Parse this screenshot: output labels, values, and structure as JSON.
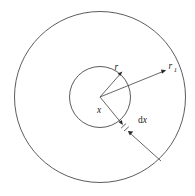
{
  "figure": {
    "type": "geometry-diagram",
    "background_color": "#ffffff",
    "line_color": "#4a4a4a",
    "label_color": "#1c1c1c",
    "canvas": {
      "width": 195,
      "height": 196
    },
    "center": {
      "x": 100,
      "y": 97
    },
    "circles": [
      {
        "name": "outer-circle",
        "cx": 100,
        "cy": 97,
        "r": 85.5
      },
      {
        "name": "inner-circle",
        "cx": 100,
        "cy": 97,
        "r": 30.5
      }
    ],
    "labels": {
      "r": "r",
      "r1_base": "r",
      "r1_sub": "1",
      "x": "x",
      "dx_d": "d",
      "dx_x": "x"
    },
    "arrows": [
      {
        "name": "radius-r-arrow",
        "from": [
          100,
          97
        ],
        "to": [
          122,
          72
        ],
        "label": "r"
      },
      {
        "name": "radius-r1-arrow",
        "from": [
          100,
          97
        ],
        "to": [
          166,
          70
        ],
        "label": "r1"
      },
      {
        "name": "radius-x-arrow",
        "from": [
          100,
          97
        ],
        "to": [
          123,
          125
        ],
        "label": "x"
      },
      {
        "name": "dx-leader-arrow",
        "from": [
          161,
          161
        ],
        "to": [
          128,
          131
        ],
        "label": "dx"
      }
    ]
  }
}
